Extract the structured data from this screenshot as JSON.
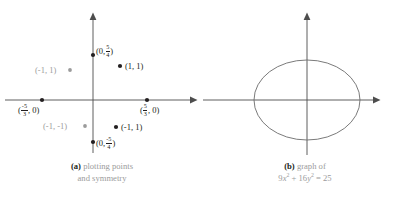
{
  "figure": {
    "panels": [
      {
        "id": "a",
        "tag": "(a)",
        "caption_line1": "plotting points",
        "caption_line2": "and symmetry",
        "axes": {
          "x_axis_arrow": "right",
          "y_axis_arrow": "up",
          "origin": [
            93,
            100
          ]
        },
        "points": [
          {
            "name": "y-intercept-positive",
            "label_prefix": "(0,",
            "label_num": "5",
            "label_den": "4",
            "label_suffix": ")",
            "x": 93,
            "y": 55,
            "color": "#231f20",
            "style": "black"
          },
          {
            "name": "point-1-1",
            "label": "(1, 1)",
            "x": 120,
            "y": 66,
            "color": "#231f20",
            "style": "black"
          },
          {
            "name": "x-intercept-negative",
            "label_prefix": "(",
            "label_num": "-5",
            "label_den": "3",
            "label_suffix": ", 0)",
            "x": 42,
            "y": 100,
            "color": "#231f20",
            "style": "black"
          },
          {
            "name": "x-intercept-positive",
            "label_prefix": "(",
            "label_num": "5",
            "label_den": "3",
            "label_suffix": ", 0)",
            "x": 147,
            "y": 100,
            "color": "#231f20",
            "style": "black"
          },
          {
            "name": "point-neg1-1-reflected",
            "label": "(-1, 1)",
            "x": 116,
            "y": 127,
            "color": "#231f20",
            "style": "black"
          },
          {
            "name": "y-intercept-negative",
            "label_prefix": "(0,",
            "label_num": "-5",
            "label_den": "4",
            "label_suffix": ")",
            "x": 93,
            "y": 142,
            "color": "#231f20",
            "style": "black"
          },
          {
            "name": "point-neg1-1-gray",
            "label": "(-1, 1)",
            "x": 70,
            "y": 70,
            "color": "#9b9b9b",
            "style": "gray"
          },
          {
            "name": "point-neg1-neg1-gray",
            "label": "(-1, -1)",
            "x": 85,
            "y": 126,
            "color": "#9b9b9b",
            "style": "gray"
          }
        ]
      },
      {
        "id": "b",
        "tag": "(b)",
        "caption_line1": "graph of",
        "equation": {
          "coef_x": "9",
          "var_x": "x",
          "exp_x": "2",
          "plus": "+",
          "coef_y": "16",
          "var_y": "y",
          "exp_y": "2",
          "equals": "=",
          "rhs": "25"
        },
        "ellipse": {
          "center": [
            104,
            100
          ],
          "semi_axis_x": 53,
          "semi_axis_y": 40
        }
      }
    ],
    "colors": {
      "ink": "#231f20",
      "gray": "#9b9b9b",
      "axis": "#4d4d4d",
      "curve": "#6b6b6b",
      "background": "#ffffff"
    }
  }
}
